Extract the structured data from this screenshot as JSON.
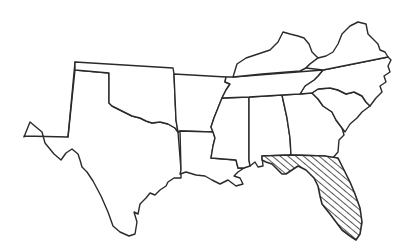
{
  "map": {
    "title": "Southern United States",
    "highlighted_state": "Florida",
    "highlight_pattern": "diagonal-hatch",
    "line_color": "#2a2a2a",
    "background": "#ffffff",
    "states": [
      {
        "name": "Texas",
        "highlighted": false
      },
      {
        "name": "Oklahoma",
        "highlighted": false
      },
      {
        "name": "Arkansas",
        "highlighted": false
      },
      {
        "name": "Louisiana",
        "highlighted": false
      },
      {
        "name": "Mississippi",
        "highlighted": false
      },
      {
        "name": "Alabama",
        "highlighted": false
      },
      {
        "name": "Georgia",
        "highlighted": false
      },
      {
        "name": "Florida",
        "highlighted": true
      },
      {
        "name": "South Carolina",
        "highlighted": false
      },
      {
        "name": "North Carolina",
        "highlighted": false
      },
      {
        "name": "Tennessee",
        "highlighted": false
      },
      {
        "name": "Kentucky",
        "highlighted": false
      },
      {
        "name": "Virginia",
        "highlighted": false
      }
    ]
  }
}
